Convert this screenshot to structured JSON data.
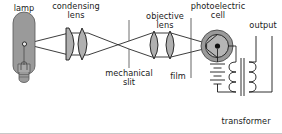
{
  "figure": {
    "background_color": "#ffffff",
    "line_color": "#1a1a1a",
    "fill_gray": "#9a9a9a",
    "fill_light": "#b5b5b5",
    "width": 282,
    "height": 134
  },
  "labels": {
    "lamp": "lamp",
    "condensing_lens": "condensing\nlens",
    "mechanical_slit": "mechanical\nslit",
    "objective_lens": "objective\nlens",
    "film": "film",
    "photoelectric_cell": "photoelectric\ncell",
    "output": "output",
    "transformer": "transformer"
  },
  "components": [
    {
      "name": "lamp",
      "kind": "light-source",
      "label": "lamp"
    },
    {
      "name": "condensing-lens",
      "kind": "lens-pair",
      "label": "condensing lens",
      "elements": 2
    },
    {
      "name": "mechanical-slit",
      "kind": "slit",
      "label": "mechanical slit"
    },
    {
      "name": "objective-lens",
      "kind": "lens-pair",
      "label": "objective lens",
      "elements": 2
    },
    {
      "name": "film",
      "kind": "film-plane",
      "label": "film"
    },
    {
      "name": "photoelectric-cell",
      "kind": "phototube",
      "label": "photoelectric cell"
    },
    {
      "name": "battery",
      "kind": "battery",
      "cells": 3
    },
    {
      "name": "transformer",
      "kind": "transformer",
      "label": "transformer",
      "coils": 2
    },
    {
      "name": "output-terminals",
      "kind": "terminals",
      "label": "output"
    }
  ],
  "light_path": {
    "description": "rays from lamp filament through condensing lens, crossing at mechanical slit, through objective lens and film, converging on photoelectric cell"
  }
}
